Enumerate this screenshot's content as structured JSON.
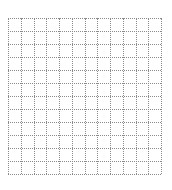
{
  "grid": {
    "columns": 12,
    "rows": 12,
    "line_style": "dotted",
    "line_color": "#8a8a8a",
    "background_color": "#ffffff"
  }
}
